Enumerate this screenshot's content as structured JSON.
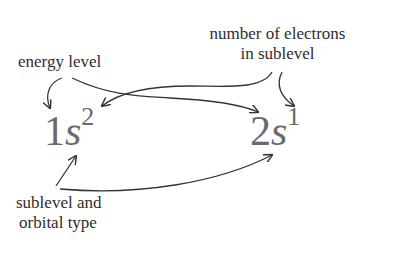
{
  "labels": {
    "energy_level": "energy level",
    "electrons_line1": "number of electrons",
    "electrons_line2": "in sublevel",
    "sublevel_line1": "sublevel and",
    "sublevel_line2": "orbital type"
  },
  "notations": [
    {
      "energy_level": "1",
      "orbital": "s",
      "electrons": "2"
    },
    {
      "energy_level": "2",
      "orbital": "s",
      "electrons": "1"
    }
  ],
  "colors": {
    "label_text": "#2e2e2e",
    "notation_text": "#6a6a6a",
    "arrow": "#333333"
  }
}
